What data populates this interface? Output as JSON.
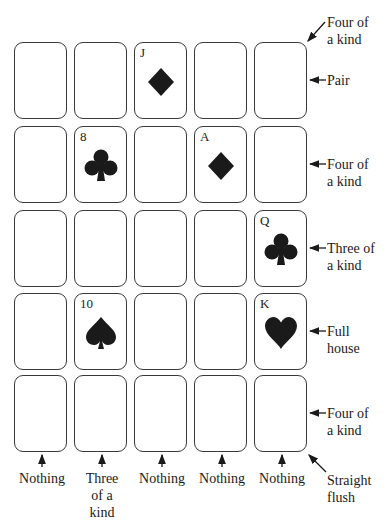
{
  "grid": {
    "rows": 5,
    "cols": 5,
    "cards": [
      {
        "row": 0,
        "col": 2,
        "rank": "J",
        "suit": "diamond"
      },
      {
        "row": 1,
        "col": 1,
        "rank": "8",
        "suit": "club"
      },
      {
        "row": 1,
        "col": 3,
        "rank": "A",
        "suit": "diamond"
      },
      {
        "row": 2,
        "col": 4,
        "rank": "Q",
        "suit": "club"
      },
      {
        "row": 3,
        "col": 1,
        "rank": "10",
        "suit": "spade"
      },
      {
        "row": 3,
        "col": 4,
        "rank": "K",
        "suit": "heart"
      }
    ]
  },
  "labels": {
    "diagonal_top": {
      "line1": "Four of",
      "line2": "a kind"
    },
    "rows": [
      {
        "line1": "Pair",
        "line2": ""
      },
      {
        "line1": "Four of",
        "line2": "a kind"
      },
      {
        "line1": "Three of",
        "line2": "a kind"
      },
      {
        "line1": "Full",
        "line2": "house"
      },
      {
        "line1": "Four of",
        "line2": "a kind"
      }
    ],
    "cols": [
      {
        "line1": "Nothing",
        "line2": "",
        "line3": ""
      },
      {
        "line1": "Three",
        "line2": "of a",
        "line3": "kind"
      },
      {
        "line1": "Nothing",
        "line2": "",
        "line3": ""
      },
      {
        "line1": "Nothing",
        "line2": "",
        "line3": ""
      },
      {
        "line1": "Nothing",
        "line2": "",
        "line3": ""
      }
    ],
    "diagonal_bottom": {
      "line1": "Straight",
      "line2": "flush"
    }
  },
  "colors": {
    "ink": "#1a1a1a",
    "card_border": "#3a3a3a",
    "background": "#ffffff"
  }
}
